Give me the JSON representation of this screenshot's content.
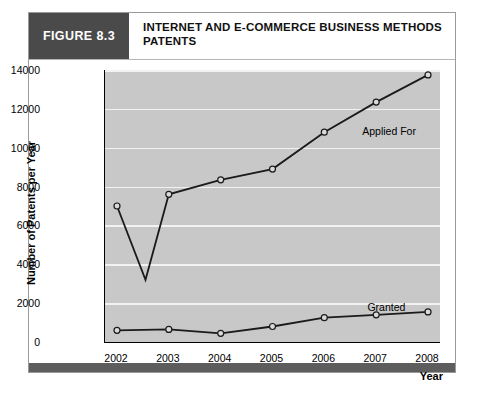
{
  "figure": {
    "number_label": "FIGURE 8.3",
    "title": "INTERNET AND E-COMMERCE BUSINESS METHODS PATENTS",
    "accent_dark": "#4a4a4a",
    "plot_background": "#c8c8c8",
    "gridline_color": "#f2f2f2",
    "line_color": "#1a1a1a",
    "marker_fill": "#d9d9d9"
  },
  "chart_data": {
    "type": "line",
    "title": "INTERNET AND E-COMMERCE BUSINESS METHODS PATENTS",
    "xlabel": "Year",
    "ylabel": "Number of Patents per Year",
    "categories": [
      "2002",
      "2003",
      "2004",
      "2005",
      "2006",
      "2007",
      "2008"
    ],
    "x": [
      2002,
      2003,
      2004,
      2005,
      2006,
      2007,
      2008
    ],
    "xlim": [
      2002,
      2008
    ],
    "ylim": [
      0,
      14000
    ],
    "yticks": [
      "0",
      "2000",
      "4000",
      "6000",
      "8000",
      "10000",
      "12000",
      "14000"
    ],
    "ytick_values": [
      0,
      2000,
      4000,
      6000,
      8000,
      10000,
      12000,
      14000
    ],
    "grid": true,
    "legend": "inline-annotations",
    "series": [
      {
        "name": "Applied For",
        "values": [
          7000,
          7600,
          8350,
          8900,
          10800,
          12350,
          13750
        ],
        "extra_points": [
          {
            "x": 2002.55,
            "y": 3200,
            "marker": false
          }
        ],
        "label_position": {
          "x": 2006.75,
          "y": 11150
        }
      },
      {
        "name": "Granted",
        "values": [
          600,
          650,
          450,
          800,
          1250,
          1400,
          1550
        ],
        "label_position": {
          "x": 2006.85,
          "y": 2100
        }
      }
    ]
  }
}
